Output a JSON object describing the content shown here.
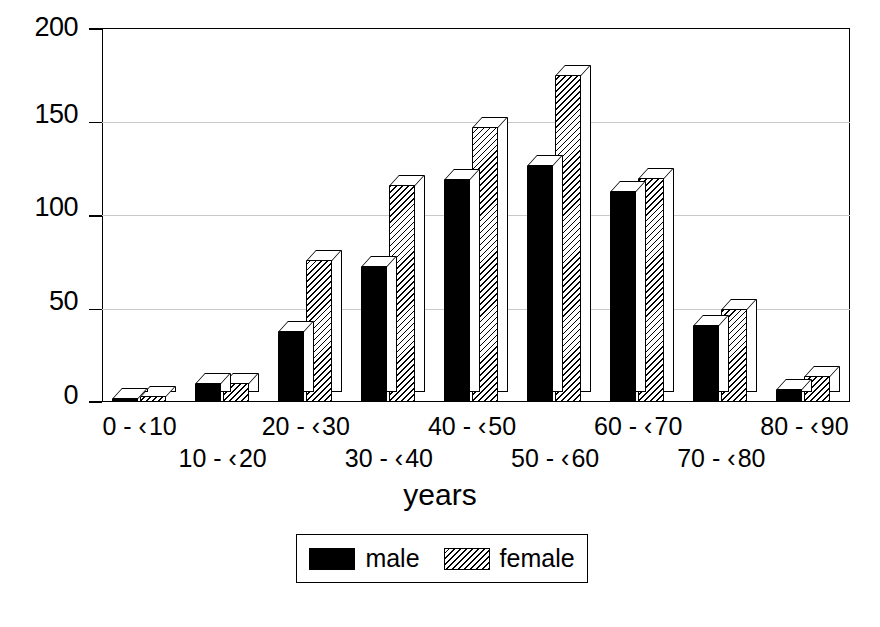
{
  "chart_data": {
    "type": "bar",
    "title": "",
    "subtitle": "",
    "xlabel": "years",
    "ylabel": "",
    "categories": [
      "0 - ‹ 10",
      "10 - ‹ 20",
      "20 - ‹ 30",
      "30 - ‹ 40",
      "40 - ‹ 50",
      "50 - ‹ 60",
      "60 - ‹ 70",
      "70 - ‹ 80",
      "80 - ‹ 90"
    ],
    "series": [
      {
        "name": "male",
        "values": [
          2,
          10,
          38,
          73,
          119,
          127,
          113,
          41,
          7
        ]
      },
      {
        "name": "female",
        "values": [
          3,
          10,
          76,
          116,
          147,
          175,
          120,
          50,
          14
        ]
      }
    ],
    "ylim": [
      0,
      200
    ],
    "yticks": [
      0,
      50,
      100,
      150,
      200
    ],
    "ytick_labels": [
      "0",
      "50",
      "100",
      "150",
      "200"
    ],
    "grid": true,
    "grid_axis": "y",
    "legend_position": "bottom-center",
    "bar_style": "3d-block",
    "colors": {
      "male": "#000000",
      "female_hatch": "#000000",
      "female_background": "#ffffff",
      "grid": "#c9c9c9",
      "axis": "#000000",
      "plot_background": "#ffffff"
    }
  },
  "legend": {
    "items": [
      {
        "label": "male",
        "swatch": "solid-black-swatch"
      },
      {
        "label": "female",
        "swatch": "hatched-swatch"
      }
    ]
  },
  "axis": {
    "x_title": "years"
  }
}
